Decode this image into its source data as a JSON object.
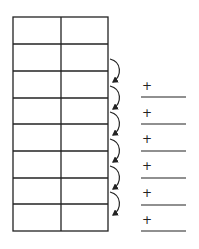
{
  "diagram": {
    "table": {
      "rows": 8,
      "columns": 2,
      "cells": [
        [
          "",
          ""
        ],
        [
          "",
          ""
        ],
        [
          "",
          ""
        ],
        [
          "",
          ""
        ],
        [
          "",
          ""
        ],
        [
          "",
          ""
        ],
        [
          "",
          ""
        ],
        [
          "",
          ""
        ]
      ]
    },
    "arrows": [
      {
        "from_row": 2,
        "to_row": 3
      },
      {
        "from_row": 3,
        "to_row": 4
      },
      {
        "from_row": 4,
        "to_row": 5
      },
      {
        "from_row": 5,
        "to_row": 6
      },
      {
        "from_row": 6,
        "to_row": 7
      },
      {
        "from_row": 7,
        "to_row": 8
      }
    ],
    "blanks": [
      {
        "symbol": "+",
        "value": ""
      },
      {
        "symbol": "+",
        "value": ""
      },
      {
        "symbol": "+",
        "value": ""
      },
      {
        "symbol": "+",
        "value": ""
      },
      {
        "symbol": "+",
        "value": ""
      },
      {
        "symbol": "+",
        "value": ""
      }
    ],
    "colors": {
      "line": "#222222",
      "background": "#ffffff"
    }
  }
}
